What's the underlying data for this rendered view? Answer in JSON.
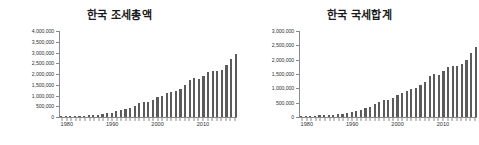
{
  "page": {
    "background_color": "#ffffff",
    "bar_color": "#5b5b5b",
    "axis_color": "#8a8a8a",
    "text_color": "#333333"
  },
  "chart_data": [
    {
      "type": "bar",
      "panel": "left",
      "title": "한국 조세총액",
      "xlabel": "",
      "ylabel": "",
      "grid": false,
      "legend": "none",
      "xlim": [
        1978,
        2018
      ],
      "ylim": [
        0,
        4000000
      ],
      "ytick_labels": [
        "0",
        "500,000",
        "1,000,000",
        "1,500,000",
        "2,000,000",
        "2,500,000",
        "3,000,000",
        "3,500,000",
        "4,000,000"
      ],
      "ytick_values": [
        0,
        500000,
        1000000,
        1500000,
        2000000,
        2500000,
        3000000,
        3500000,
        4000000
      ],
      "xtick_labels": [
        "1980",
        "1990",
        "2000",
        "2010"
      ],
      "xtick_values": [
        1980,
        1990,
        2000,
        2010
      ],
      "categories": [
        1979,
        1980,
        1981,
        1982,
        1983,
        1984,
        1985,
        1986,
        1987,
        1988,
        1989,
        1990,
        1991,
        1992,
        1993,
        1994,
        1995,
        1996,
        1997,
        1998,
        1999,
        2000,
        2001,
        2002,
        2003,
        2004,
        2005,
        2006,
        2007,
        2008,
        2009,
        2010,
        2011,
        2012,
        2013,
        2014,
        2015,
        2016,
        2017
      ],
      "values": [
        28000,
        36000,
        44000,
        52000,
        62000,
        68000,
        76000,
        89000,
        110000,
        135000,
        165000,
        210000,
        265000,
        305000,
        355000,
        435000,
        530000,
        640000,
        720000,
        715000,
        790000,
        930000,
        1000000,
        1100000,
        1180000,
        1220000,
        1320000,
        1470000,
        1710000,
        1820000,
        1780000,
        1920000,
        2090000,
        2120000,
        2130000,
        2210000,
        2400000,
        2700000,
        2920000
      ],
      "annotations": []
    },
    {
      "type": "bar",
      "panel": "right",
      "title": "한국 국세합계",
      "xlabel": "",
      "ylabel": "",
      "grid": false,
      "legend": "none",
      "xlim": [
        1978,
        2018
      ],
      "ylim": [
        0,
        3000000
      ],
      "ytick_labels": [
        "0",
        "500,000",
        "1,000,000",
        "1,500,000",
        "2,000,000",
        "2,500,000",
        "3,000,000"
      ],
      "ytick_values": [
        0,
        500000,
        1000000,
        1500000,
        2000000,
        2500000,
        3000000
      ],
      "xtick_labels": [
        "1980",
        "1990",
        "2000",
        "2010"
      ],
      "xtick_values": [
        1980,
        1990,
        2000,
        2010
      ],
      "categories": [
        1979,
        1980,
        1981,
        1982,
        1983,
        1984,
        1985,
        1986,
        1987,
        1988,
        1989,
        1990,
        1991,
        1992,
        1993,
        1994,
        1995,
        1996,
        1997,
        1998,
        1999,
        2000,
        2001,
        2002,
        2003,
        2004,
        2005,
        2006,
        2007,
        2008,
        2009,
        2010,
        2011,
        2012,
        2013,
        2014,
        2015,
        2016,
        2017
      ],
      "values": [
        24000,
        31000,
        38000,
        45000,
        53000,
        58000,
        65000,
        76000,
        94000,
        115000,
        140000,
        178000,
        222000,
        256000,
        298000,
        364000,
        440000,
        530000,
        595000,
        590000,
        655000,
        775000,
        830000,
        915000,
        980000,
        1015000,
        1100000,
        1220000,
        1420000,
        1510000,
        1480000,
        1600000,
        1740000,
        1765000,
        1775000,
        1840000,
        2000000,
        2250000,
        2440000
      ],
      "annotations": []
    }
  ]
}
